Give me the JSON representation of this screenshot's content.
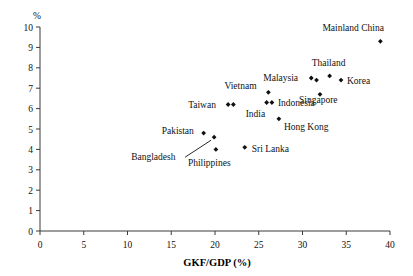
{
  "chart_data": {
    "type": "scatter",
    "title": "",
    "xlabel": "GKF/GDP (%)",
    "ylabel": "%",
    "xlim": [
      0,
      40
    ],
    "ylim": [
      0,
      10
    ],
    "xticks": [
      0,
      5,
      10,
      15,
      20,
      25,
      30,
      35,
      40
    ],
    "yticks": [
      0,
      1,
      2,
      3,
      4,
      5,
      6,
      7,
      8,
      9,
      10
    ],
    "grid": false,
    "legend": "none",
    "marker": "filled-diamond",
    "points": [
      {
        "label": "Mainland China",
        "x": 38.9,
        "y": 9.3,
        "label_dx": -58,
        "label_dy": -10,
        "leader": false
      },
      {
        "label": "Thailand",
        "x": 33.1,
        "y": 7.6,
        "label_dx": -18,
        "label_dy": -10,
        "leader": false
      },
      {
        "label": "Korea",
        "x": 34.4,
        "y": 7.4,
        "label_dx": 6,
        "label_dy": 4,
        "leader": false
      },
      {
        "label": "Malaysia",
        "x": 31.0,
        "y": 7.5,
        "label_dx": -48,
        "label_dy": 3,
        "leader": false
      },
      {
        "label": "",
        "x": 31.6,
        "y": 7.4,
        "label_dx": 0,
        "label_dy": 0,
        "leader": false
      },
      {
        "label": "Singapore",
        "x": 32.0,
        "y": 6.7,
        "label_dx": -21,
        "label_dy": 9,
        "leader": false
      },
      {
        "label": "Vietnam",
        "x": 26.1,
        "y": 6.8,
        "label_dx": -44,
        "label_dy": -3,
        "leader": false
      },
      {
        "label": "Indonesia",
        "x": 26.5,
        "y": 6.3,
        "label_dx": 6,
        "label_dy": 4,
        "leader": false
      },
      {
        "label": "Taiwan",
        "x": 21.5,
        "y": 6.2,
        "label_dx": -40,
        "label_dy": 3,
        "leader": false
      },
      {
        "label": "",
        "x": 22.1,
        "y": 6.2,
        "label_dx": 0,
        "label_dy": 0,
        "leader": false
      },
      {
        "label": "India",
        "x": 25.9,
        "y": 6.3,
        "label_dx": -21,
        "label_dy": 15,
        "leader": false
      },
      {
        "label": "Hong Kong",
        "x": 27.3,
        "y": 5.5,
        "label_dx": 5,
        "label_dy": 11,
        "leader": false
      },
      {
        "label": "Pakistan",
        "x": 18.7,
        "y": 4.8,
        "label_dx": -42,
        "label_dy": 1,
        "leader": false
      },
      {
        "label": "Bangladesh",
        "x": 19.9,
        "y": 4.6,
        "label_dx": -83,
        "label_dy": 23,
        "leader": true
      },
      {
        "label": "Philippines",
        "x": 20.1,
        "y": 4.0,
        "label_dx": -28,
        "label_dy": 17,
        "leader": false
      },
      {
        "label": "Sri Lanka",
        "x": 23.4,
        "y": 4.1,
        "label_dx": 7,
        "label_dy": 5,
        "leader": false
      }
    ]
  },
  "axis": {
    "y_unit": "%",
    "x_title": "GKF/GDP (%)"
  },
  "colors": {
    "marker": "#111111",
    "axis": "#3a3a3a",
    "background": "#ffffff"
  }
}
